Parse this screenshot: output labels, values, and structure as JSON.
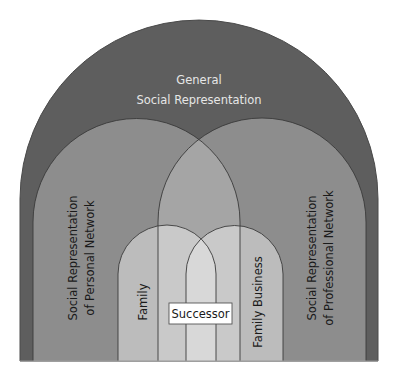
{
  "diagram": {
    "title_line1": "General",
    "title_line2": "Social Representation",
    "personal_line1": "Social Representation",
    "personal_line2": "of Personal Network",
    "professional_line1": "Social Representation",
    "professional_line2": "of Professional Network",
    "family": "Family",
    "family_business": "Family Business",
    "successor": "Successor"
  },
  "colors": {
    "general": "#5e5e5e",
    "network": "#8d8d8d",
    "network_overlap": "#a5a5a5",
    "family_arch": "#bcbcbc",
    "family_in_overlap": "#c9c9c9",
    "center": "#d8d8d8",
    "successor_box": "#ffffff",
    "outline": "#3a3a3a"
  }
}
